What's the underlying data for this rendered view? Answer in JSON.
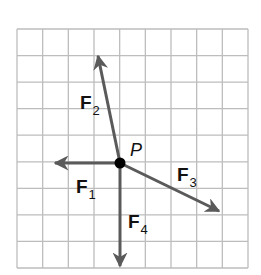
{
  "diagram": {
    "grid": {
      "columns": 9,
      "rows": 9,
      "left": 17,
      "top": 29,
      "right": 248,
      "bottom": 268,
      "line_color": "#bdbdbd"
    },
    "point": {
      "label": "P",
      "x": 120,
      "y": 163,
      "grid_position": [
        4,
        5
      ],
      "color": "#000000"
    },
    "vector_color": "#5a5a5a",
    "vectors": [
      {
        "id": "F1",
        "name": "F",
        "subscript": "1",
        "tip": [
          55,
          163
        ],
        "grid_components": [
          -2.5,
          0
        ],
        "label_pos": [
          76,
          177
        ]
      },
      {
        "id": "F2",
        "name": "F",
        "subscript": "2",
        "tip": [
          98,
          56
        ],
        "grid_components": [
          -0.85,
          4
        ],
        "label_pos": [
          80,
          93
        ]
      },
      {
        "id": "F3",
        "name": "F",
        "subscript": "3",
        "tip": [
          219,
          211
        ],
        "grid_components": [
          3.85,
          -1.85
        ],
        "label_pos": [
          177,
          165
        ]
      },
      {
        "id": "F4",
        "name": "F",
        "subscript": "4",
        "tip": [
          120,
          266
        ],
        "grid_components": [
          0,
          -4
        ],
        "label_pos": [
          128,
          212
        ]
      }
    ]
  }
}
